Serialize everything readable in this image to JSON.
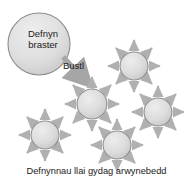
{
  "figure": {
    "type": "diagram",
    "background_color": "#ffffff",
    "caption": "Defnynnau llai gydag arwynebedd"
  },
  "colors": {
    "droplet_fill_light": "#e4e4e4",
    "droplet_fill_dark": "#c9c9c9",
    "droplet_stroke": "#8d8d8d",
    "arrow": "#b0b0b0",
    "bile_arrow": "#a6a6a6",
    "text": "#1a1a1a"
  },
  "fat_droplet": {
    "label": "Defnyn braster",
    "cx": 39,
    "cy": 44,
    "r": 31
  },
  "bile_arrow": {
    "label": "Bustl",
    "from_x": 63,
    "from_y": 57,
    "to_x": 87,
    "to_y": 82
  },
  "small_droplets": [
    {
      "name": "droplet-center-left",
      "cx": 92,
      "cy": 104,
      "r": 15
    },
    {
      "name": "droplet-top-right",
      "cx": 134,
      "cy": 66,
      "r": 14
    },
    {
      "name": "droplet-right",
      "cx": 158,
      "cy": 112,
      "r": 14
    },
    {
      "name": "droplet-bottom-left",
      "cx": 45,
      "cy": 135,
      "r": 14
    },
    {
      "name": "droplet-bottom-mid",
      "cx": 117,
      "cy": 145,
      "r": 14
    }
  ],
  "arrow_directions_per_droplet": 8,
  "arrow_direction_angles_deg": [
    0,
    45,
    90,
    135,
    180,
    225,
    270,
    315
  ]
}
